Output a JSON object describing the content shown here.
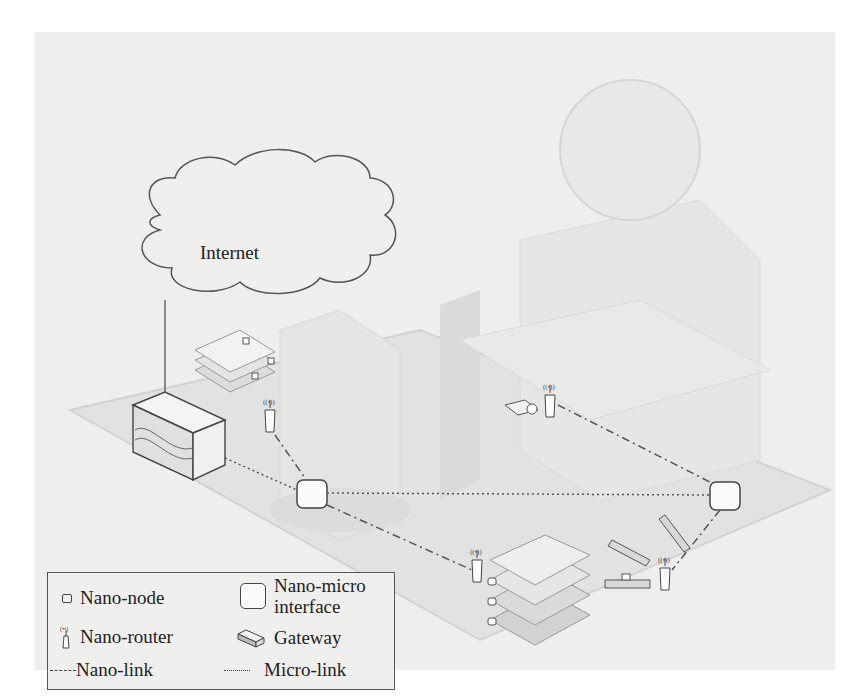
{
  "diagram": {
    "cloud": {
      "label": "Internet"
    },
    "nodes": {
      "gateway": {
        "label": "Gateway"
      },
      "interfaces": [
        {
          "id": "interface-left"
        },
        {
          "id": "interface-right"
        }
      ],
      "routers": [
        {
          "id": "router-desk-left"
        },
        {
          "id": "router-monitor"
        },
        {
          "id": "router-floor"
        },
        {
          "id": "router-right"
        }
      ]
    },
    "links": {
      "micro": [
        "gateway-to-interface-left",
        "interface-left-to-interface-right"
      ],
      "nano": [
        "router-desk-left-to-interface-left",
        "interface-left-to-router-floor",
        "router-monitor-to-interface-right",
        "interface-right-to-router-right"
      ]
    }
  },
  "legend": {
    "items": [
      {
        "icon": "nano-node-icon",
        "label": "Nano-node"
      },
      {
        "icon": "nano-micro-interface-icon",
        "label_line1": "Nano-micro",
        "label_line2": "interface"
      },
      {
        "icon": "nano-router-icon",
        "label": "Nano-router"
      },
      {
        "icon": "gateway-icon",
        "label": "Gateway"
      },
      {
        "icon": "nano-link-icon",
        "label": "Nano-link"
      },
      {
        "icon": "micro-link-icon",
        "label": "Micro-link"
      }
    ]
  },
  "colors": {
    "background": "#eeeeed",
    "line": "#555555",
    "text": "#222222"
  }
}
